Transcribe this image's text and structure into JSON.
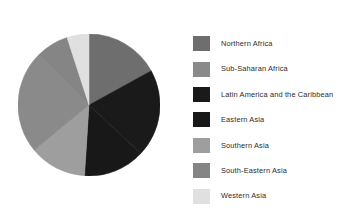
{
  "chart_data": {
    "type": "pie",
    "title": "",
    "legend_position": "right",
    "center": {
      "x": 89,
      "y": 105
    },
    "radius": 71,
    "start_angle_deg": 0,
    "direction": "clockwise",
    "categories": [
      "Northern Africa",
      "Sub-Saharan Africa",
      "Latin America and the Caribbean",
      "Eastern Asia",
      "Southern Asia",
      "South-Eastern Asia",
      "Western Asia"
    ],
    "colors": [
      "#6e6e6e",
      "#8a8a8a",
      "#1a1a1a",
      "#181818",
      "#9e9e9e",
      "#858585",
      "#e0e0e0"
    ],
    "values": [
      17.0,
      23.5,
      20.0,
      14.0,
      13.0,
      7.5,
      5.0
    ],
    "slices": [
      {
        "label": "Northern Africa",
        "value": 17.0,
        "color": "#6e6e6e",
        "start_deg": 0.0,
        "end_deg": 61.2
      },
      {
        "label": "Latin America and the Caribbean",
        "value": 20.0,
        "color": "#1a1a1a",
        "start_deg": 61.2,
        "end_deg": 133.2
      },
      {
        "label": "Eastern Asia",
        "value": 14.0,
        "color": "#181818",
        "start_deg": 133.2,
        "end_deg": 183.6
      },
      {
        "label": "Southern Asia",
        "value": 13.0,
        "color": "#9e9e9e",
        "start_deg": 183.6,
        "end_deg": 230.4
      },
      {
        "label": "Sub-Saharan Africa",
        "value": 23.5,
        "color": "#8a8a8a",
        "start_deg": 230.4,
        "end_deg": 315.0
      },
      {
        "label": "South-Eastern Asia",
        "value": 7.5,
        "color": "#858585",
        "start_deg": 315.0,
        "end_deg": 342.0
      },
      {
        "label": "Western Asia",
        "value": 5.0,
        "color": "#e0e0e0",
        "start_deg": 342.0,
        "end_deg": 360.0
      }
    ]
  },
  "legend": {
    "items": [
      {
        "label": "Northern Africa",
        "color": "#6e6e6e"
      },
      {
        "label": "Sub-Saharan Africa",
        "color": "#8a8a8a"
      },
      {
        "label": "Latin America and the Caribbean",
        "color": "#1a1a1a"
      },
      {
        "label": "Eastern Asia",
        "color": "#181818"
      },
      {
        "label": "Southern Asia",
        "color": "#9e9e9e"
      },
      {
        "label": "South-Eastern Asia",
        "color": "#858585"
      },
      {
        "label": "Western Asia",
        "color": "#e0e0e0"
      }
    ]
  }
}
